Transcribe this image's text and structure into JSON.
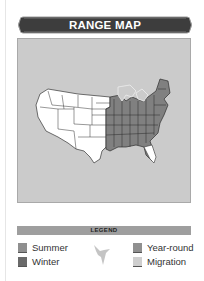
{
  "header": {
    "title": "RANGE MAP"
  },
  "map": {
    "region": "United States",
    "colors": {
      "background": "#cbcbcb",
      "land": "#ffffff",
      "year_round": "#8a8a8a",
      "winter": "#6f6f6f",
      "migration": "#b9b9b9",
      "borders": "#333333"
    }
  },
  "legend": {
    "title": "LEGEND",
    "items": [
      {
        "label": "Summer",
        "color": "#8f8f8f"
      },
      {
        "label": "Winter",
        "color": "#6a6a6a"
      },
      {
        "label": "Year-round",
        "color": "#909090"
      },
      {
        "label": "Migration",
        "color": "#cfcfcf"
      }
    ],
    "icon": "bird-silhouette-icon"
  }
}
